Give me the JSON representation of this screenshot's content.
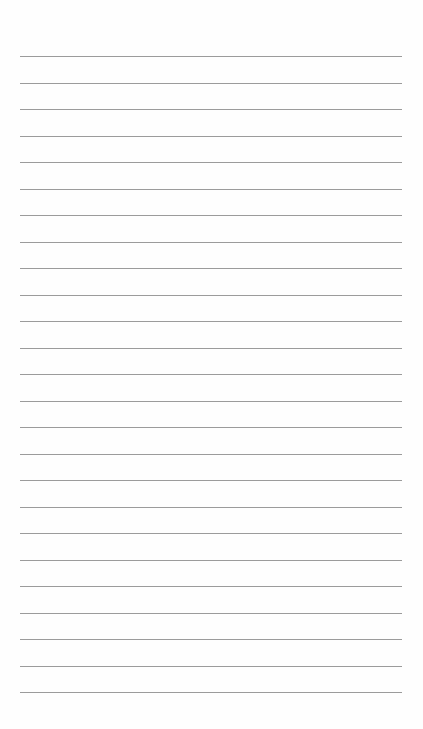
{
  "page": {
    "type": "lined-paper",
    "background_color": "#fefefe",
    "line_color": "#8a8a8a",
    "line_count": 25,
    "first_line_y": 56,
    "line_spacing": 26.5,
    "line_left": 20,
    "line_width": 382
  }
}
